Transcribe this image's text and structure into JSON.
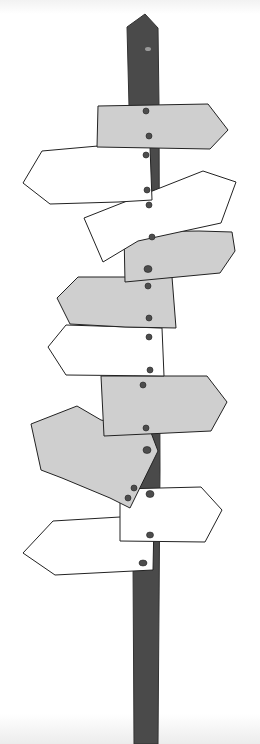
{
  "illustration": {
    "subject": "signpost with many directional arrow signs",
    "colors": {
      "pole": "#4a4a4a",
      "sign_gray": "#cfcfcf",
      "sign_white": "#ffffff",
      "outline": "#222222",
      "nail": "#4d4d4d",
      "background": "#ffffff"
    },
    "signs": [
      {
        "id": 1,
        "fill": "gray",
        "direction": "right"
      },
      {
        "id": 2,
        "fill": "white",
        "direction": "left"
      },
      {
        "id": 3,
        "fill": "white",
        "direction": "right"
      },
      {
        "id": 4,
        "fill": "gray",
        "direction": "right"
      },
      {
        "id": 5,
        "fill": "gray",
        "direction": "left"
      },
      {
        "id": 6,
        "fill": "white",
        "direction": "left"
      },
      {
        "id": 7,
        "fill": "gray",
        "direction": "right"
      },
      {
        "id": 8,
        "fill": "gray",
        "direction": "left"
      },
      {
        "id": 9,
        "fill": "white",
        "direction": "right"
      },
      {
        "id": 10,
        "fill": "white",
        "direction": "left"
      }
    ]
  }
}
